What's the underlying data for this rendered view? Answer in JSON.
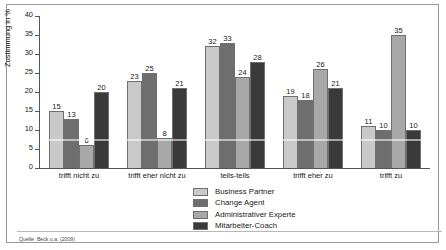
{
  "chart_data": {
    "type": "bar",
    "title": "",
    "xlabel": "",
    "ylabel": "Zustimmung in %",
    "ylim": [
      0,
      40
    ],
    "yticks": [
      0,
      5,
      10,
      15,
      20,
      25,
      30,
      35,
      40
    ],
    "grid": false,
    "legend_position": "bottom-center",
    "categories": [
      "trifft nicht zu",
      "trifft eher nicht zu",
      "teils-teils",
      "trifft eher zu",
      "trifft zu"
    ],
    "series": [
      {
        "name": "Business Partner",
        "color": "#c9c9c9",
        "values": [
          15,
          23,
          32,
          19,
          11
        ]
      },
      {
        "name": "Change Agent",
        "color": "#6e6e6e",
        "values": [
          13,
          25,
          33,
          18,
          10
        ]
      },
      {
        "name": "Administrativer Experte",
        "color": "#a8a8a8",
        "values": [
          6,
          8,
          24,
          26,
          35
        ]
      },
      {
        "name": "Mitarbeiter-Coach",
        "color": "#3a3a3a",
        "values": [
          20,
          21,
          28,
          21,
          10
        ]
      }
    ]
  },
  "axis": {
    "y_title": "Zustimmung in %",
    "y_tick_labels": [
      "40",
      "35",
      "30",
      "25",
      "20",
      "15",
      "10",
      "5",
      "0"
    ]
  },
  "legend": {
    "items": [
      {
        "label": "Business Partner"
      },
      {
        "label": "Change Agent"
      },
      {
        "label": "Administrativer Experte"
      },
      {
        "label": "Mitarbeiter-Coach"
      }
    ]
  },
  "footer": {
    "source": "Quelle:  Beck u.a. (2009)"
  }
}
